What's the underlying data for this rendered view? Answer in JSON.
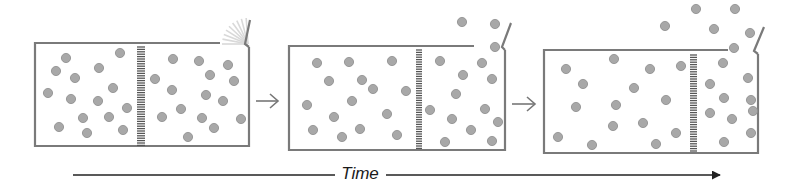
{
  "diagram": {
    "type": "effusion-over-time",
    "colors": {
      "outline": "#7a7a7a",
      "molecule_fill": "#a8a8a8",
      "molecule_stroke": "#8c8c8c",
      "partition": "#555555",
      "arrow": "#777777",
      "time_axis": "#222222",
      "fan": "#d9d9d9"
    },
    "molecule_radius": 4.6,
    "panels": [
      {
        "id": "panel-1",
        "box": {
          "x": 35,
          "y": 43,
          "w": 214,
          "h": 103
        },
        "top_line_end": 220,
        "partition": {
          "x": 137,
          "w": 8,
          "y1": 47,
          "y2": 146
        },
        "flap": {
          "x1": 248,
          "y1": 44,
          "x2": 250,
          "y2": 20
        },
        "flap_opening": true,
        "molecules": [
          [
            66,
            58
          ],
          [
            120,
            53
          ],
          [
            56,
            71
          ],
          [
            75,
            78
          ],
          [
            99,
            68
          ],
          [
            48,
            93
          ],
          [
            113,
            88
          ],
          [
            71,
            99
          ],
          [
            98,
            101
          ],
          [
            127,
            108
          ],
          [
            83,
            118
          ],
          [
            109,
            117
          ],
          [
            59,
            127
          ],
          [
            87,
            133
          ],
          [
            123,
            130
          ],
          [
            173,
            59
          ],
          [
            199,
            61
          ],
          [
            228,
            65
          ],
          [
            155,
            79
          ],
          [
            210,
            75
          ],
          [
            234,
            81
          ],
          [
            172,
            90
          ],
          [
            206,
            95
          ],
          [
            223,
            101
          ],
          [
            181,
            109
          ],
          [
            162,
            117
          ],
          [
            202,
            118
          ],
          [
            241,
            119
          ],
          [
            214,
            128
          ],
          [
            188,
            137
          ]
        ]
      },
      {
        "id": "panel-2",
        "box": {
          "x": 289,
          "y": 46,
          "w": 216,
          "h": 104
        },
        "top_line_end": 474,
        "partition": {
          "x": 416,
          "w": 6,
          "y1": 50,
          "y2": 150
        },
        "flap": {
          "x1": 505,
          "y1": 47,
          "x2": 511,
          "y2": 23
        },
        "flap_opening": false,
        "molecules": [
          [
            317,
            63
          ],
          [
            349,
            62
          ],
          [
            392,
            61
          ],
          [
            329,
            81
          ],
          [
            362,
            80
          ],
          [
            373,
            89
          ],
          [
            406,
            91
          ],
          [
            307,
            105
          ],
          [
            352,
            101
          ],
          [
            334,
            117
          ],
          [
            387,
            114
          ],
          [
            313,
            130
          ],
          [
            360,
            129
          ],
          [
            342,
            137
          ],
          [
            397,
            135
          ],
          [
            440,
            61
          ],
          [
            482,
            63
          ],
          [
            463,
            75
          ],
          [
            492,
            79
          ],
          [
            456,
            94
          ],
          [
            485,
            109
          ],
          [
            430,
            110
          ],
          [
            452,
            119
          ],
          [
            498,
            122
          ],
          [
            471,
            130
          ],
          [
            445,
            142
          ],
          [
            492,
            141
          ],
          [
            462,
            22
          ],
          [
            495,
            24
          ],
          [
            495,
            47
          ]
        ]
      },
      {
        "id": "panel-3",
        "box": {
          "x": 544,
          "y": 50,
          "w": 214,
          "h": 103
        },
        "top_line_end": 728,
        "partition": {
          "x": 690,
          "w": 7,
          "y1": 55,
          "y2": 153
        },
        "flap": {
          "x1": 757,
          "y1": 51,
          "x2": 764,
          "y2": 27
        },
        "flap_opening": false,
        "molecules": [
          [
            566,
            69
          ],
          [
            614,
            59
          ],
          [
            650,
            69
          ],
          [
            681,
            66
          ],
          [
            583,
            84
          ],
          [
            634,
            88
          ],
          [
            666,
            100
          ],
          [
            576,
            107
          ],
          [
            616,
            105
          ],
          [
            613,
            126
          ],
          [
            643,
            123
          ],
          [
            558,
            137
          ],
          [
            676,
            133
          ],
          [
            592,
            145
          ],
          [
            656,
            144
          ],
          [
            723,
            63
          ],
          [
            710,
            84
          ],
          [
            748,
            78
          ],
          [
            724,
            98
          ],
          [
            751,
            100
          ],
          [
            753,
            111
          ],
          [
            710,
            113
          ],
          [
            732,
            119
          ],
          [
            751,
            133
          ],
          [
            724,
            142
          ],
          [
            696,
            9
          ],
          [
            735,
            9
          ],
          [
            665,
            26
          ],
          [
            714,
            29
          ],
          [
            750,
            33
          ],
          [
            734,
            48
          ]
        ]
      }
    ],
    "transition_arrows": [
      {
        "x1": 256,
        "x2": 278,
        "y": 101
      },
      {
        "x1": 512,
        "x2": 535,
        "y": 104
      }
    ],
    "time_axis": {
      "label": "Time",
      "y": 175,
      "x1": 73,
      "x2": 720,
      "gap_start": 335,
      "gap_end": 386
    }
  }
}
